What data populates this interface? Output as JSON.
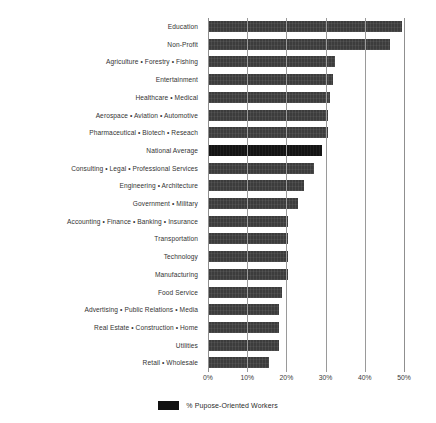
{
  "chart_data": {
    "type": "bar",
    "orientation": "horizontal",
    "title": "",
    "subtitle": "",
    "xlabel": "",
    "ylabel": "",
    "xlim": [
      0,
      50
    ],
    "xtick_labels": [
      "0%",
      "10%",
      "20%",
      "30%",
      "40%",
      "50%"
    ],
    "xticks": [
      0,
      10,
      20,
      30,
      40,
      50
    ],
    "grid": true,
    "grid_axis": "x",
    "legend_position": "bottom-center",
    "legend": [
      {
        "label": "% Pupose-Oriented Workers",
        "color": "#111111"
      }
    ],
    "series_name": "% Pupose-Oriented Workers",
    "highlight_category": "National Average",
    "colors": {
      "bar": "#3c3c3c",
      "highlight": "#141414",
      "grid": "#9a9a9a",
      "text": "#333333"
    },
    "categories": [
      "Education",
      "Non-Profit",
      "Agriculture • Forestry • Fishing",
      "Entertainment",
      "Healthcare • Medical",
      "Aerospace • Aviation • Automotive",
      "Pharmaceutical • Biotech • Reseach",
      "National Average",
      "Consulting • Legal • Professional Services",
      "Engineering • Architecture",
      "Government • Military",
      "Accounting • Finance • Banking • Insurance",
      "Transportation",
      "Technology",
      "Manufacturing",
      "Food Service",
      "Advertising • Public Relations • Media",
      "Real Estate • Construction • Home",
      "Utilities",
      "Retail • Wholesale"
    ],
    "values": [
      49.5,
      46.5,
      32.5,
      32,
      31,
      30.5,
      30.5,
      29,
      27,
      24.5,
      23,
      20.5,
      20.5,
      20.5,
      20.5,
      19,
      18,
      18,
      18,
      15.5
    ]
  }
}
